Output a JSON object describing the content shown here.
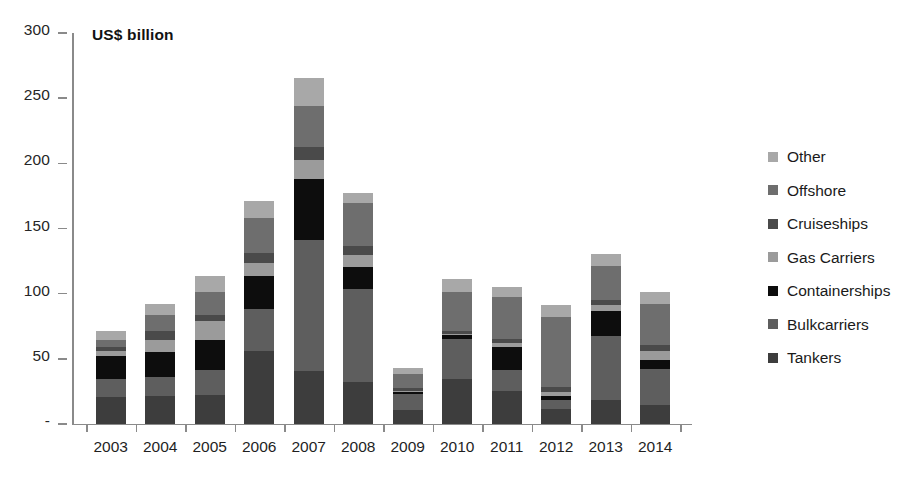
{
  "axis_title": "US$ billion",
  "legend": {
    "items": [
      {
        "label": "Other",
        "color": "#a8a8a8"
      },
      {
        "label": "Offshore",
        "color": "#6e6e6e"
      },
      {
        "label": "Cruiseships",
        "color": "#4a4a4a"
      },
      {
        "label": "Gas Carriers",
        "color": "#9b9b9b"
      },
      {
        "label": "Containerships",
        "color": "#0d0d0d"
      },
      {
        "label": "Bulkcarriers",
        "color": "#5e5e5e"
      },
      {
        "label": "Tankers",
        "color": "#3d3d3d"
      }
    ]
  },
  "y_axis": {
    "ticks": [
      "300",
      "250",
      "200",
      "150",
      "100",
      "50",
      "-"
    ],
    "tick_values": [
      300,
      250,
      200,
      150,
      100,
      50,
      0
    ],
    "min": 0,
    "max": 300
  },
  "chart_data": {
    "type": "bar",
    "subtype": "stacked-bar",
    "title": "",
    "subtitle": "",
    "xlabel": "",
    "ylabel": "US$ billion",
    "ylim": [
      0,
      300
    ],
    "grid": false,
    "legend_position": "right",
    "categories": [
      "2003",
      "2004",
      "2005",
      "2006",
      "2007",
      "2008",
      "2009",
      "2010",
      "2011",
      "2012",
      "2013",
      "2014"
    ],
    "stack_order_bottom_to_top": [
      "Tankers",
      "Bulkcarriers",
      "Containerships",
      "Gas Carriers",
      "Cruiseships",
      "Offshore",
      "Other"
    ],
    "series": [
      {
        "name": "Tankers",
        "color": "#3d3d3d",
        "values": [
          20,
          21,
          22,
          56,
          40,
          32,
          10,
          34,
          25,
          11,
          18,
          14
        ]
      },
      {
        "name": "Bulkcarriers",
        "color": "#5e5e5e",
        "values": [
          14,
          15,
          19,
          32,
          101,
          71,
          13,
          31,
          16,
          7,
          49,
          28
        ]
      },
      {
        "name": "Containerships",
        "color": "#0d0d0d",
        "values": [
          18,
          19,
          23,
          25,
          47,
          17,
          1,
          3,
          18,
          3,
          19,
          7
        ]
      },
      {
        "name": "Gas Carriers",
        "color": "#9b9b9b",
        "values": [
          4,
          9,
          15,
          10,
          14,
          9,
          1,
          1,
          3,
          3,
          5,
          7
        ]
      },
      {
        "name": "Cruiseships",
        "color": "#4a4a4a",
        "values": [
          3,
          7,
          4,
          8,
          10,
          7,
          2,
          2,
          3,
          4,
          4,
          4
        ]
      },
      {
        "name": "Offshore",
        "color": "#6e6e6e",
        "values": [
          5,
          12,
          18,
          27,
          32,
          33,
          11,
          30,
          32,
          54,
          26,
          32
        ]
      },
      {
        "name": "Other",
        "color": "#a8a8a8",
        "values": [
          7,
          9,
          12,
          13,
          21,
          8,
          5,
          10,
          8,
          9,
          9,
          9
        ]
      }
    ],
    "totals": [
      71,
      92,
      113,
      171,
      266,
      177,
      43,
      111,
      105,
      91,
      130,
      101
    ]
  }
}
